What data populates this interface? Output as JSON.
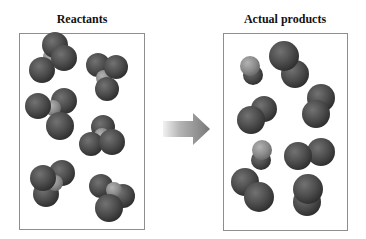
{
  "titles": {
    "left": "Reactants",
    "right": "Actual products"
  },
  "colors": {
    "sphere_dark": "#4a4a4a",
    "sphere_dark_edge": "#2e2e2e",
    "sphere_dark_highlight": "#7a7a7a",
    "sphere_light": "#8c8c8c",
    "sphere_light_highlight": "#b0b0b0",
    "arrow_start": "#e6e6e6",
    "arrow_end": "#7d7d7d",
    "box_border": "#8e8e8e"
  },
  "panels": {
    "reactants": {
      "molecule_count": 6,
      "atoms_per_molecule": "3 dark + 1 light (center)"
    },
    "products": {
      "molecule_count": 9,
      "description": "diatomic molecules"
    }
  },
  "arrow": {
    "direction": "right",
    "meaning": "reaction"
  }
}
